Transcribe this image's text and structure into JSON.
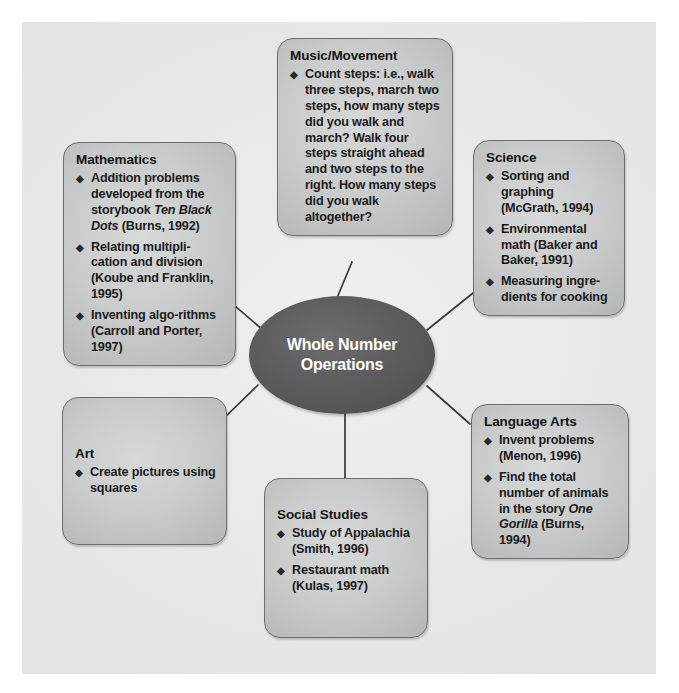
{
  "diagram": {
    "type": "concept-map",
    "center": {
      "label": "Whole Number\nOperations"
    },
    "bullet_glyph": "◆",
    "colors": {
      "canvas_background": "#e9eaea",
      "node_fill": "#cbcccc",
      "node_border": "#6e6e6e",
      "center_fill": "#5a5a5a",
      "center_text": "#ffffff",
      "text": "#1b1b1b",
      "connector": "#3a3a3a"
    },
    "nodes": [
      {
        "id": "music",
        "title": "Music/Movement",
        "bullets": [
          "Count steps: i.e., walk three steps, march two steps, how many steps did you walk and march? Walk four steps straight ahead and two steps to the right. How many steps did you walk altogether?"
        ]
      },
      {
        "id": "mathematics",
        "title": "Mathematics",
        "bullets_html": [
          "Addition problems developed from the storybook <i>Ten Black Dots</i> (Burns, 1992)",
          "Relating multipli-cation and division (Koube and Franklin, 1995)",
          "Inventing algo-rithms (Carroll and Porter, 1997)"
        ],
        "bullets": [
          "Addition problems developed from the storybook Ten Black Dots (Burns, 1992)",
          "Relating multiplication and division (Koube and Franklin, 1995)",
          "Inventing algorithms (Carroll and Porter, 1997)"
        ]
      },
      {
        "id": "science",
        "title": "Science",
        "bullets": [
          "Sorting and graphing (McGrath, 1994)",
          "Environmental math (Baker and Baker, 1991)",
          "Measuring ingre-dients for cooking"
        ]
      },
      {
        "id": "language-arts",
        "title": "Language Arts",
        "bullets_html": [
          "Invent problems (Menon, 1996)",
          "Find the total number of animals in the story <i>One Gorilla</i> (Burns, 1994)"
        ],
        "bullets": [
          "Invent problems (Menon, 1996)",
          "Find the total number of animals in the story One Gorilla (Burns, 1994)"
        ]
      },
      {
        "id": "social-studies",
        "title": "Social Studies",
        "bullets": [
          "Study of Appalachia (Smith, 1996)",
          "Restaurant math (Kulas, 1997)"
        ]
      },
      {
        "id": "art",
        "title": "Art",
        "bullets": [
          "Create pictures using squares"
        ]
      }
    ]
  }
}
